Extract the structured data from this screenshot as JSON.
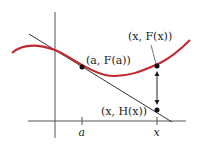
{
  "diagram": {
    "colors": {
      "curve": "#c0282e",
      "tangent": "#333333",
      "axes": "#555555",
      "points": "#111111",
      "background": "#ffffff"
    },
    "labels": {
      "point_a": "(a, F(a))",
      "point_x_curve": "(x, F(x))",
      "point_x_line": "(x, H(x))",
      "tick_a": "a",
      "tick_x": "x"
    },
    "points": [
      {
        "name": "a-Fa",
        "x": 82,
        "y": 67
      },
      {
        "name": "x-Fx",
        "x": 157,
        "y": 66
      },
      {
        "name": "x-Hx",
        "x": 157,
        "y": 110
      }
    ]
  }
}
